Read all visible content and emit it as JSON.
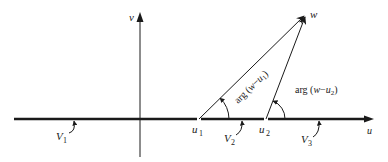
{
  "figure": {
    "type": "complex-plane-diagram",
    "axes": {
      "horizontal_label": "u",
      "vertical_label": "v"
    },
    "points": {
      "u1": {
        "base": "u",
        "sub": "1"
      },
      "u2": {
        "base": "u",
        "sub": "2"
      },
      "w": {
        "label": "w"
      }
    },
    "angle_labels": {
      "arg1": {
        "prefix": "arg (",
        "var": "w",
        "minus": "−",
        "base": "u",
        "sub": "1",
        "suffix": ")"
      },
      "arg2": {
        "prefix": "arg (",
        "var": "w",
        "minus": "−",
        "base": "u",
        "sub": "2",
        "suffix": ")"
      }
    },
    "segments": {
      "V1": {
        "base": "V",
        "sub": "1"
      },
      "V2": {
        "base": "V",
        "sub": "2"
      },
      "V3": {
        "base": "V",
        "sub": "3"
      }
    },
    "colors": {
      "ink": "#1a1a1a",
      "background": "#ffffff"
    }
  }
}
